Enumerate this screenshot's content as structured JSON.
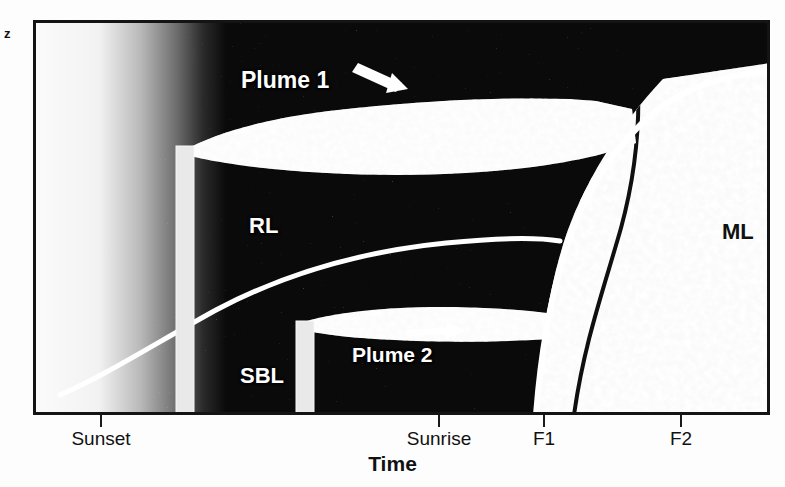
{
  "figure": {
    "type": "schematic-diagram",
    "axes": {
      "y_label": "z",
      "x_label": "Time",
      "x_ticks": [
        {
          "label": "Sunset",
          "x_px": 100
        },
        {
          "label": "Sunrise",
          "x_px": 438
        },
        {
          "label": "F1",
          "x_px": 543
        },
        {
          "label": "F2",
          "x_px": 680
        }
      ]
    },
    "regions": [
      {
        "name": "RL",
        "label": "RL",
        "meaning": "Residual Layer"
      },
      {
        "name": "SBL",
        "label": "SBL",
        "meaning": "Stable Boundary Layer"
      },
      {
        "name": "ML",
        "label": "ML",
        "meaning": "Mixed Layer"
      }
    ],
    "annotations": [
      {
        "name": "plume-1",
        "label": "Plume 1",
        "arrow": "down-right"
      },
      {
        "name": "plume-2",
        "label": "Plume 2",
        "arrow": "right"
      }
    ],
    "stacks": [
      {
        "name": "tall-stack",
        "x_px": 173,
        "top_px": 143,
        "height_px": 272
      },
      {
        "name": "short-stack",
        "x_px": 293,
        "top_px": 318,
        "height_px": 97
      }
    ],
    "colors": {
      "frame": "#141414",
      "background_dark": "#0a0a0a",
      "curve": "#ffffff",
      "stack": "#e8e8e8",
      "text_light": "#ffffff",
      "text_dark": "#111111"
    }
  }
}
